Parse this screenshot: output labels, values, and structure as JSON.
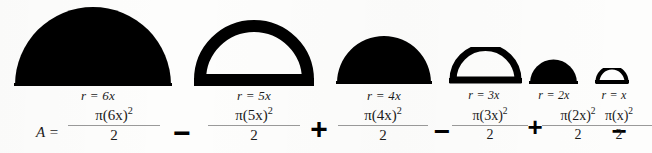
{
  "figure": {
    "equation_lead": "A =",
    "terms": [
      {
        "id": "term-6x",
        "radius_label": "r = 6x",
        "numerator_pi": "π(6x)",
        "numerator_exp": "2",
        "denominator": "2",
        "shape": "semicircle-filled",
        "radius_multiple": 6,
        "operator_before": ""
      },
      {
        "id": "term-5x",
        "radius_label": "r = 5x",
        "numerator_pi": "π(5x)",
        "numerator_exp": "2",
        "denominator": "2",
        "shape": "semicircle-outline",
        "radius_multiple": 5,
        "operator_before": "−"
      },
      {
        "id": "term-4x",
        "radius_label": "r = 4x",
        "numerator_pi": "π(4x)",
        "numerator_exp": "2",
        "denominator": "2",
        "shape": "semicircle-filled",
        "radius_multiple": 4,
        "operator_before": "+"
      },
      {
        "id": "term-3x",
        "radius_label": "r = 3x",
        "numerator_pi": "π(3x)",
        "numerator_exp": "2",
        "denominator": "2",
        "shape": "semicircle-outline",
        "radius_multiple": 3,
        "operator_before": "−"
      },
      {
        "id": "term-2x",
        "radius_label": "r = 2x",
        "numerator_pi": "π(2x)",
        "numerator_exp": "2",
        "denominator": "2",
        "shape": "semicircle-filled",
        "radius_multiple": 2,
        "operator_before": "+"
      },
      {
        "id": "term-1x",
        "radius_label": "r = x",
        "numerator_pi": "π(x)",
        "numerator_exp": "2",
        "denominator": "2",
        "shape": "semicircle-outline",
        "radius_multiple": 1,
        "operator_before": "−"
      }
    ],
    "colors": {
      "ink": "#000000",
      "text": "#1b1b1b",
      "rule": "#9a9a9a",
      "page": "#fdfdfc"
    }
  }
}
